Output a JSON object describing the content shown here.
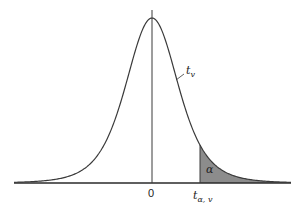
{
  "figure": {
    "type": "t-distribution density with shaded upper tail",
    "curve_label": "t",
    "curve_label_sub": "v",
    "area_label": "α",
    "origin_label": "0",
    "critical_label": "t",
    "critical_label_sub": "α, v",
    "colors": {
      "line": "#3a3a3a",
      "shade": "#8c8c8c",
      "axis": "#2a2a2a",
      "background": "#ffffff"
    }
  },
  "geometry": {
    "center_x": 152,
    "baseline_y": 183,
    "peak_y": 18,
    "axis_top_y": 10,
    "x_start": 14,
    "x_end": 291,
    "critical_x": 200,
    "dof": 5,
    "scale": 27
  }
}
